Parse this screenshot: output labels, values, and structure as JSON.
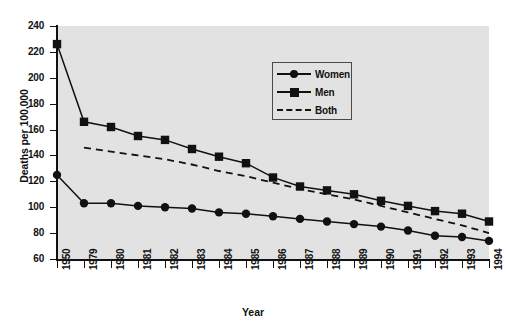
{
  "chart_data": {
    "type": "line",
    "title": "",
    "xlabel": "Year",
    "ylabel": "Deaths per 100,000",
    "categories": [
      "1950",
      "1979",
      "1980",
      "1981",
      "1982",
      "1983",
      "1984",
      "1985",
      "1986",
      "1987",
      "1988",
      "1989",
      "1990",
      "1991",
      "1992",
      "1993",
      "1994"
    ],
    "ylim": [
      60,
      240
    ],
    "yticks": [
      60,
      80,
      100,
      120,
      140,
      160,
      180,
      200,
      220,
      240
    ],
    "grid": false,
    "legend_position": "top-center-right",
    "series": [
      {
        "name": "Women",
        "marker": "circle",
        "linestyle": "solid",
        "color": "#111111",
        "values": [
          125,
          103,
          103,
          101,
          100,
          99,
          96,
          95,
          93,
          91,
          89,
          87,
          85,
          82,
          78,
          77,
          74
        ]
      },
      {
        "name": "Men",
        "marker": "square",
        "linestyle": "solid",
        "color": "#111111",
        "values": [
          226,
          166,
          162,
          155,
          152,
          145,
          139,
          134,
          123,
          116,
          113,
          110,
          105,
          101,
          97,
          95,
          89
        ]
      },
      {
        "name": "Both",
        "marker": "none",
        "linestyle": "dashed",
        "color": "#111111",
        "values": [
          null,
          146,
          143,
          140,
          137,
          133,
          128,
          124,
          119,
          114,
          110,
          106,
          101,
          96,
          91,
          86,
          80
        ]
      }
    ]
  },
  "legend": {
    "entries": [
      {
        "label": "Women",
        "key": "circle-solid-line"
      },
      {
        "label": "Men",
        "key": "square-solid-line"
      },
      {
        "label": "Both",
        "key": "dashed-line"
      }
    ]
  },
  "axes": {
    "x_title": "Year",
    "y_title": "Deaths per 100,000"
  },
  "colors": {
    "plot_background": "#e2e2e2",
    "page_background": "#ffffff",
    "ink": "#111111",
    "legend_border": "#4a4a4a"
  }
}
